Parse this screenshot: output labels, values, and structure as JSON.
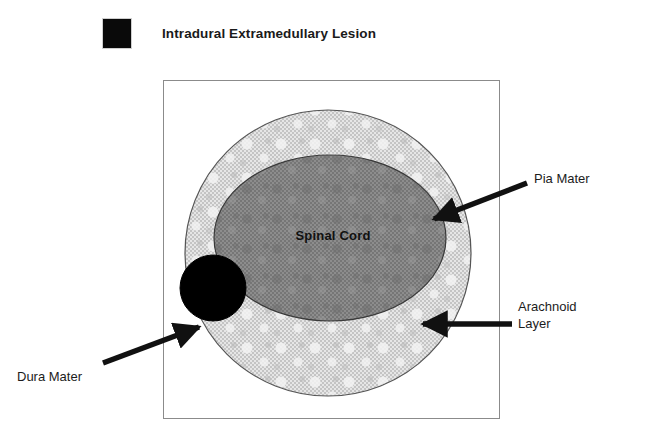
{
  "page": {
    "background_color": "#ffffff",
    "width": 653,
    "height": 440
  },
  "legend": {
    "swatch_name": "lesion-swatch",
    "swatch_color": "#0a0a0a",
    "title": "Intradural Extramedullary Lesion"
  },
  "diagram": {
    "frame_border_color": "#8b8b8b",
    "structures": [
      {
        "key": "arachnoid",
        "label": "Arachnoid Layer",
        "shape": "circle",
        "fill_color": "#d8d8d8",
        "stroke_color": "#4a4a4a"
      },
      {
        "key": "spinal_cord",
        "label": "Spinal Cord",
        "shape": "ellipse",
        "fill_color": "#868686",
        "stroke_color": "#3c3c3c"
      },
      {
        "key": "lesion",
        "label": "Intradural Extramedullary Lesion",
        "shape": "circle",
        "fill_color": "#000000",
        "stroke_color": "#000000"
      }
    ],
    "inner_label": "Spinal Cord"
  },
  "annotations": [
    {
      "key": "pia_mater",
      "text": "Pia Mater",
      "arrow_color": "#111111",
      "points_to": "spinal-cord-right-edge"
    },
    {
      "key": "arachnoid_layer",
      "line1": "Arachnoid",
      "line2": "Layer",
      "arrow_color": "#111111",
      "points_to": "arachnoid-ring"
    },
    {
      "key": "dura_mater",
      "text": "Dura Mater",
      "arrow_color": "#111111",
      "points_to": "outer-circle-edge"
    }
  ]
}
